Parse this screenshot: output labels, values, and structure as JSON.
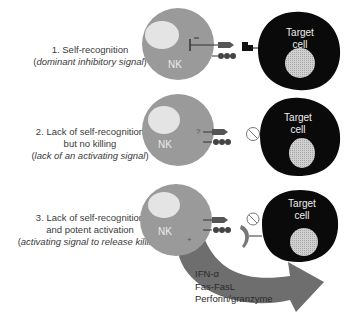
{
  "panels": [
    {
      "title": "1. Self-recognition",
      "subtitle_prefix": "(",
      "subtitle": "dominant inhibitory signal",
      "subtitle_suffix": ")",
      "nk_label": "NK",
      "target_label_line1": "Target",
      "target_label_line2": "cell",
      "nk_symbol": "inhibit"
    },
    {
      "title": "2. Lack of self-recognition",
      "title_line2": "but no killing",
      "subtitle_prefix": "(",
      "subtitle": "lack of an activating signal",
      "subtitle_suffix": ")",
      "nk_label": "NK",
      "nk_symbol": "?",
      "target_label_line1": "Target",
      "target_label_line2": "cell"
    },
    {
      "title": "3. Lack of self-recognition",
      "title_line2": "and potent activation",
      "subtitle_prefix": "(",
      "subtitle": "activating signal to release killing",
      "subtitle_suffix": ")",
      "nk_label": "NK",
      "nk_symbol": "+",
      "target_label_line1": "Target",
      "target_label_line2": "cell"
    }
  ],
  "effector_products": [
    "IFN-α",
    "Fas-FasL",
    "Perforin/granzyme"
  ],
  "colors": {
    "nk_cell": "#9a9a9a",
    "nk_nucleus": "#e4e4e4",
    "target_cell": "#0a0a0a",
    "target_nucleus": "#c8c8c8",
    "arrow": "#6e6e6e",
    "text": "#3a3a3a"
  }
}
